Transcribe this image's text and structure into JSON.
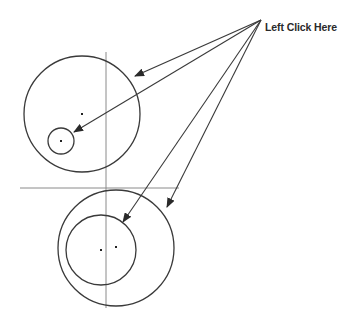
{
  "diagram": {
    "callout": {
      "text": "Left Click Here",
      "origin": [
        261,
        20
      ],
      "text_pos": [
        265,
        21
      ]
    },
    "colors": {
      "stroke": "#3a3a3a",
      "construction": "#8a8a8a",
      "background": "#ffffff"
    },
    "construction_lines": [
      {
        "name": "vertical-axis-line",
        "x1": 106,
        "y1": 52,
        "x2": 106,
        "y2": 308
      },
      {
        "name": "horizontal-axis-line",
        "x1": 20,
        "y1": 188,
        "x2": 179,
        "y2": 188
      }
    ],
    "circles": [
      {
        "name": "upper-large-circle",
        "cx": 82,
        "cy": 114,
        "r": 58
      },
      {
        "name": "upper-small-circle",
        "cx": 61,
        "cy": 141,
        "r": 13
      },
      {
        "name": "lower-outer-circle",
        "cx": 116,
        "cy": 248,
        "r": 58
      },
      {
        "name": "lower-inner-circle",
        "cx": 101,
        "cy": 250,
        "r": 35
      }
    ],
    "center_points": [
      {
        "name": "upper-large-center-point",
        "x": 82,
        "y": 114
      },
      {
        "name": "upper-small-center-point",
        "x": 61,
        "y": 141
      },
      {
        "name": "lower-inner-center-point",
        "x": 101,
        "y": 250
      },
      {
        "name": "lower-outer-center-point",
        "x": 116,
        "y": 247
      }
    ],
    "arrows": [
      {
        "name": "arrow-to-upper-large-circle",
        "x1": 261,
        "y1": 20,
        "x2": 135,
        "y2": 76
      },
      {
        "name": "arrow-to-upper-small-circle",
        "x1": 261,
        "y1": 20,
        "x2": 74,
        "y2": 132
      },
      {
        "name": "arrow-to-lower-inner-circle",
        "x1": 261,
        "y1": 20,
        "x2": 123,
        "y2": 222
      },
      {
        "name": "arrow-to-lower-outer-circle",
        "x1": 261,
        "y1": 20,
        "x2": 167,
        "y2": 207
      }
    ]
  }
}
